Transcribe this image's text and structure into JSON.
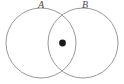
{
  "figure": {
    "type": "venn-diagram",
    "background_color": "#ffffff",
    "stroke_color": "#8d8d8d",
    "marker_color": "#1a1a1a",
    "label_color": "#4a4a4a",
    "width": 124,
    "height": 84
  },
  "labels": {
    "circle_a": "A",
    "circle_b": "B"
  },
  "shapes": {
    "circle_a": {
      "cx": 41,
      "cy": 43,
      "r": 35
    },
    "circle_b": {
      "cx": 83,
      "cy": 43,
      "r": 35
    },
    "point": {
      "cx": 62.5,
      "cy": 43,
      "r": 3.4
    }
  },
  "chart_data": {
    "type": "scatter",
    "title": "",
    "xlabel": "",
    "ylabel": "",
    "grid": false,
    "legend_position": "none",
    "annotations": [
      "A",
      "B"
    ],
    "sets": [
      {
        "name": "A",
        "center": [
          41,
          43
        ],
        "radius": 35
      },
      {
        "name": "B",
        "center": [
          83,
          43
        ],
        "radius": 35
      }
    ],
    "points": [
      {
        "label": "",
        "x": 62.5,
        "y": 43,
        "region": "A-intersect-B"
      }
    ]
  }
}
